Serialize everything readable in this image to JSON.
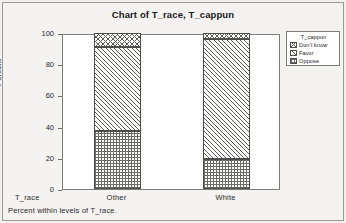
{
  "window": {
    "background_color": "#f4f3f1",
    "border_color": "#9a9a96"
  },
  "chart_data": {
    "type": "bar",
    "subtype": "stacked-bar-100pct",
    "title": "Chart of T_race, T_cappun",
    "xlabel": "T_race",
    "ylabel": "Percent",
    "categories": [
      "Other",
      "White"
    ],
    "ylim": [
      0,
      100
    ],
    "yticks": [
      0,
      20,
      40,
      60,
      80,
      100
    ],
    "ytick_labels": [
      "0",
      "20",
      "40",
      "60",
      "80",
      "100"
    ],
    "grid": false,
    "legend_position": "right-outside",
    "legend_title": "T_cappun",
    "series": [
      {
        "name": "Oppose",
        "pattern": "checkerboard",
        "values": [
          37,
          19
        ]
      },
      {
        "name": "Favor",
        "pattern": "diagonal",
        "values": [
          54,
          77
        ]
      },
      {
        "name": "Don't know",
        "pattern": "crosshatch",
        "values": [
          9,
          4
        ]
      }
    ],
    "cumulative_tops": {
      "Other": {
        "Oppose": 37,
        "Favor": 91,
        "Don't know": 100
      },
      "White": {
        "Oppose": 19,
        "Favor": 96,
        "Don't know": 100
      }
    },
    "annotations": [
      "Percent within levels of T_race."
    ]
  },
  "footnote": "Percent within levels of T_race."
}
